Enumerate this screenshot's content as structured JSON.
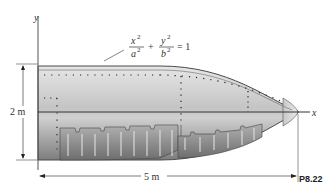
{
  "figure": {
    "problem_label": "P8.22",
    "axis_x_label": "x",
    "axis_y_label": "y",
    "equation": {
      "term1_num": "x",
      "term1_den": "a",
      "term2_num": "y",
      "term2_den": "b",
      "exponent": "2",
      "plus": "+",
      "rhs": "= 1"
    },
    "dimensions": {
      "height_label": "2 m",
      "length_label": "5 m"
    },
    "colors": {
      "body_fill_light": "#d9d9d9",
      "body_fill_dark": "#8c8c8c",
      "outline": "#4a4a4a",
      "line": "#333333"
    }
  }
}
